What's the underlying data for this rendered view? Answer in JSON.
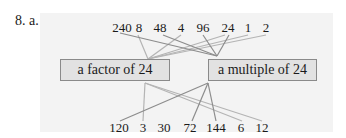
{
  "problem": {
    "label": "8. a."
  },
  "colors": {
    "panel": "#f3f3f3",
    "box_fill": "#e2e2e2",
    "box_border": "#8a8a8a",
    "line_dark": "#8c8c8c",
    "line_light": "#b4b4b4"
  },
  "boxes": {
    "factor": {
      "label": "a factor of 24"
    },
    "multiple": {
      "label": "a multiple of 24"
    }
  },
  "top_numbers": [
    {
      "value": "240",
      "target": "multiple"
    },
    {
      "value": "8",
      "target": "factor"
    },
    {
      "value": "48",
      "target": "multiple"
    },
    {
      "value": "4",
      "target": "factor"
    },
    {
      "value": "96",
      "target": "multiple"
    },
    {
      "value": "24",
      "target": "both"
    },
    {
      "value": "1",
      "target": "factor"
    },
    {
      "value": "2",
      "target": "factor"
    }
  ],
  "bottom_numbers": [
    {
      "value": "120",
      "target": "multiple"
    },
    {
      "value": "3",
      "target": "factor"
    },
    {
      "value": "30",
      "target": "none"
    },
    {
      "value": "72",
      "target": "multiple"
    },
    {
      "value": "144",
      "target": "multiple"
    },
    {
      "value": "6",
      "target": "factor"
    },
    {
      "value": "12",
      "target": "factor"
    }
  ]
}
